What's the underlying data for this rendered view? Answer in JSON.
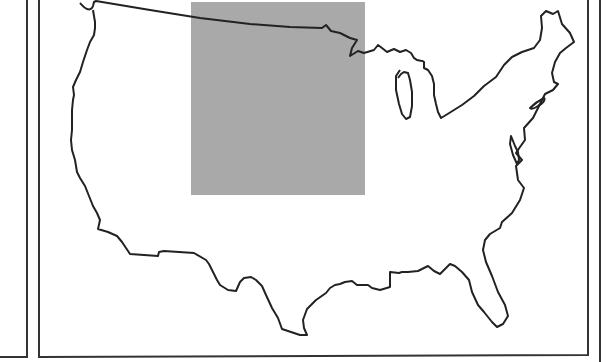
{
  "map": {
    "subject": "Contiguous United States outline",
    "style": "black-and-white line map",
    "highlight": {
      "shape": "rectangle",
      "color": "#a9a9a9",
      "x": 191,
      "y": 2,
      "width": 174,
      "height": 193
    },
    "outline_color": "#222222",
    "frame_color": "#333333",
    "background": "#ffffff"
  }
}
